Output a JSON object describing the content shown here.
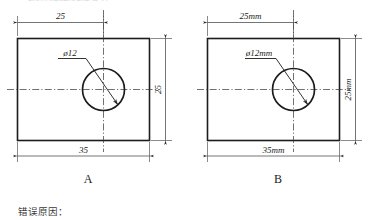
{
  "page": {
    "background_color": "#ffffff",
    "line_color": "#1c1c1c",
    "clipped_header_text": "机械制图错误判断练习"
  },
  "figures": [
    {
      "id": "figure-a",
      "label": "A",
      "top_dimension": "25",
      "hole_label": "ø12",
      "right_dimension": "25",
      "bottom_dimension": "35"
    },
    {
      "id": "figure-b",
      "label": "B",
      "top_dimension": "25mm",
      "hole_label": "ø12mm",
      "right_dimension": "25mm",
      "bottom_dimension": "35mm"
    }
  ],
  "caption": {
    "prompt": "错误原因："
  }
}
